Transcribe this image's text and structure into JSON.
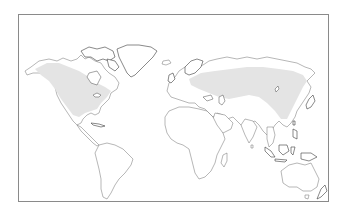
{
  "map": {
    "type": "world-distribution-map",
    "projection": "equirectangular",
    "frame_color": "#8a8a8a",
    "land_fill": "#ffffff",
    "coastline_color": "#6e6e6e",
    "range_color": "#e4e4e4",
    "shaded_regions": [
      {
        "name": "north-america-range",
        "label": "Canada and United States"
      },
      {
        "name": "eurasia-range",
        "label": "Europe, Russia, Central Asia and China"
      }
    ]
  }
}
